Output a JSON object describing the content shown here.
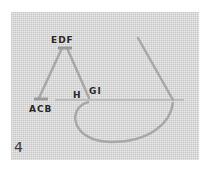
{
  "figure": {
    "step_number": "4",
    "labels": {
      "top": "EDF",
      "bottom_left": "ACB",
      "mid_h": "H",
      "mid_gi": "GI"
    },
    "colors": {
      "fabric": "#d9d9d9",
      "thread": "#a8a8a8",
      "text": "#2a2a2a"
    }
  }
}
